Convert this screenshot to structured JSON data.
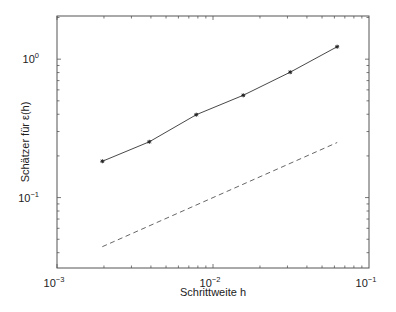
{
  "chart_data": {
    "type": "line",
    "title": "",
    "xlabel": "Schrittweite h",
    "ylabel": "Schätzer für ε(h)",
    "xscale": "log",
    "yscale": "log",
    "xlim": [
      0.001,
      0.1
    ],
    "ylim": [
      0.031,
      2.05
    ],
    "grid": false,
    "legend": null,
    "x_ticks": [
      {
        "value": 0.001,
        "base": "10",
        "exp": "−3"
      },
      {
        "value": 0.01,
        "base": "10",
        "exp": "−2"
      },
      {
        "value": 0.1,
        "base": "10",
        "exp": "−1"
      }
    ],
    "y_ticks": [
      {
        "value": 1,
        "base": "10",
        "exp": "0"
      },
      {
        "value": 0.1,
        "base": "10",
        "exp": "−1"
      }
    ],
    "series": [
      {
        "name": "Schätzer",
        "style": "solid",
        "marker": "asterisk",
        "color": "#333333",
        "x": [
          0.001953,
          0.003906,
          0.007813,
          0.015625,
          0.03125,
          0.0625
        ],
        "y": [
          0.183,
          0.253,
          0.397,
          0.548,
          0.805,
          1.23
        ]
      },
      {
        "name": "Referenz h^(1/2)",
        "style": "dashed",
        "marker": "none",
        "color": "#555555",
        "x": [
          0.001953,
          0.0625
        ],
        "y": [
          0.0442,
          0.25
        ]
      }
    ]
  }
}
